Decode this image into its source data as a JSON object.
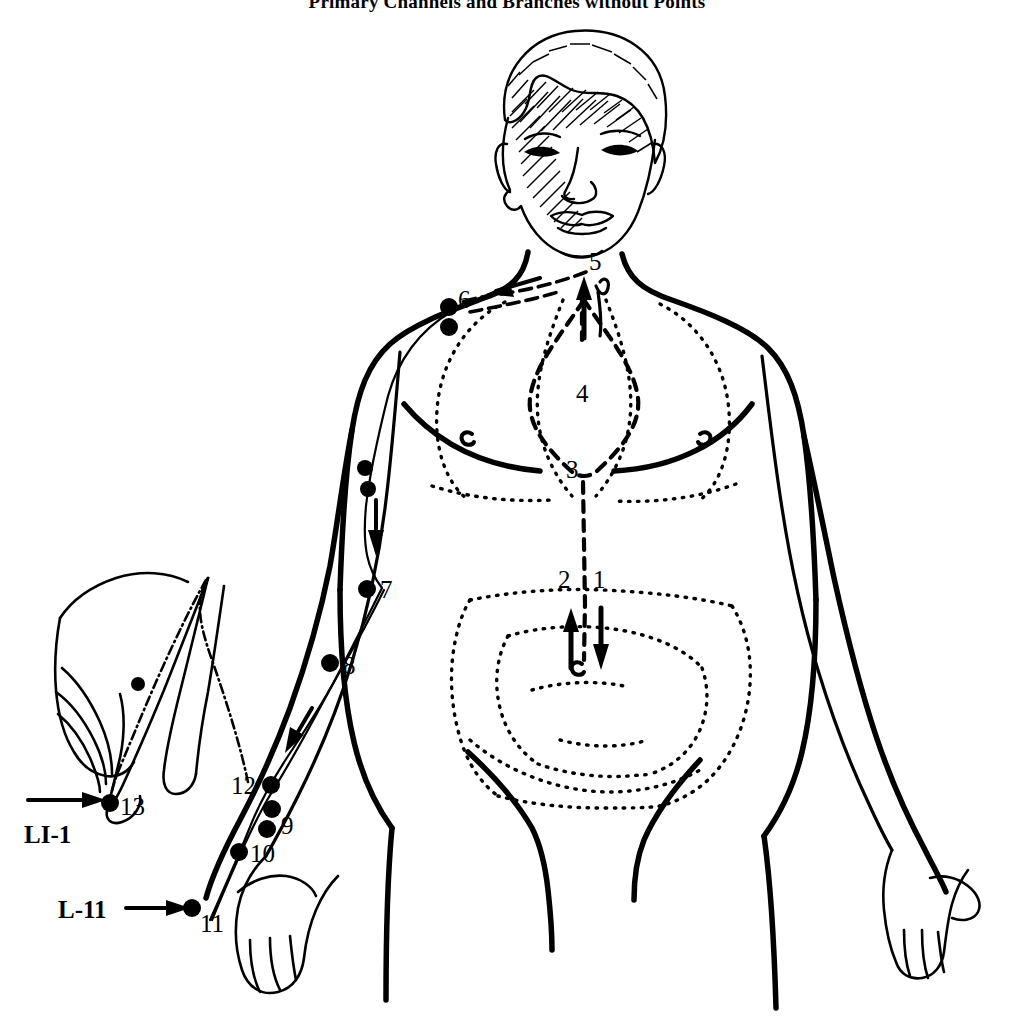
{
  "page": {
    "title": "Primary Channels and Branches without Points",
    "background_color": "#ffffff",
    "ink_color": "#000000",
    "width": 1014,
    "height": 1024
  },
  "figure": {
    "name": "anatomical-channel-diagram",
    "inset": "left-hand detail showing index finger and thumb"
  },
  "callouts": [
    {
      "id": "li1",
      "label": "LI-1",
      "points_to": "13",
      "arrow": "right"
    },
    {
      "id": "l11",
      "label": "L-11",
      "points_to": "11",
      "arrow": "right"
    }
  ],
  "channel_points": [
    {
      "n": "1",
      "x": 600,
      "y": 580,
      "region": "abdomen - descending branch"
    },
    {
      "n": "2",
      "x": 566,
      "y": 580,
      "region": "abdomen - ascending branch"
    },
    {
      "n": "3",
      "x": 574,
      "y": 470,
      "region": "diaphragm"
    },
    {
      "n": "4",
      "x": 584,
      "y": 393,
      "region": "lung"
    },
    {
      "n": "5",
      "x": 596,
      "y": 261,
      "region": "throat"
    },
    {
      "n": "6",
      "x": 463,
      "y": 300,
      "region": "shoulder / upper chest"
    },
    {
      "n": "7",
      "x": 384,
      "y": 589,
      "region": "upper arm"
    },
    {
      "n": "8",
      "x": 347,
      "y": 665,
      "region": "forearm"
    },
    {
      "n": "9",
      "x": 286,
      "y": 824,
      "region": "wrist"
    },
    {
      "n": "10",
      "x": 256,
      "y": 853,
      "region": "hand dorsum"
    },
    {
      "n": "11",
      "x": 208,
      "y": 922,
      "region": "thumb tip"
    },
    {
      "n": "12",
      "x": 246,
      "y": 786,
      "region": "wrist branch origin"
    },
    {
      "n": "13",
      "x": 127,
      "y": 806,
      "region": "index finger tip"
    }
  ],
  "unlabeled_points": [
    {
      "x": 364,
      "y": 468,
      "region": "upper arm"
    },
    {
      "x": 368,
      "y": 489,
      "region": "upper arm"
    },
    {
      "x": 449,
      "y": 307,
      "region": "shoulder upper dot"
    },
    {
      "x": 449,
      "y": 326,
      "region": "shoulder lower dot"
    },
    {
      "x": 272,
      "y": 800,
      "region": "wrist"
    },
    {
      "x": 272,
      "y": 819,
      "region": "wrist"
    }
  ],
  "arrows": [
    {
      "id": "throat-up",
      "direction": "up",
      "region": "throat / trachea"
    },
    {
      "id": "throat-to-shoulder",
      "direction": "left",
      "region": "clavicle, dashed"
    },
    {
      "id": "upper-arm-down",
      "direction": "down",
      "region": "upper arm"
    },
    {
      "id": "forearm-down",
      "direction": "down",
      "region": "forearm"
    },
    {
      "id": "abdomen-up",
      "direction": "up",
      "region": "abdomen, point 2"
    },
    {
      "id": "abdomen-down",
      "direction": "down",
      "region": "abdomen, point 1"
    },
    {
      "id": "li1-callout",
      "direction": "right",
      "region": "LI-1 label"
    },
    {
      "id": "l11-callout",
      "direction": "right",
      "region": "L-11 label"
    }
  ],
  "organs": [
    {
      "name": "lung",
      "style": "dashed",
      "label": "4"
    },
    {
      "name": "diaphragm",
      "style": "dotted",
      "label": "3"
    },
    {
      "name": "large-intestine",
      "style": "dotted",
      "label": ""
    },
    {
      "name": "small-intestine",
      "style": "dotted",
      "label": ""
    },
    {
      "name": "stomach-midline",
      "style": "dashed",
      "label": ""
    }
  ]
}
